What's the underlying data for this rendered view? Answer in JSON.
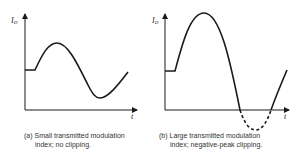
{
  "panels": [
    {
      "id": "a",
      "y_label": "I",
      "y_label_sub": "D",
      "x_label": "t",
      "caption_line1": "(a) Small transmitted modulation",
      "caption_line2": "index; no clipping.",
      "clipping": false
    },
    {
      "id": "b",
      "y_label": "I",
      "y_label_sub": "D",
      "x_label": "t",
      "caption_line1": "(b) Large transmitted modulation",
      "caption_line2": "index; negative-peak clipping.",
      "clipping": true
    }
  ],
  "colors": {
    "stroke": "#1a1a1a",
    "text": "#333333"
  }
}
